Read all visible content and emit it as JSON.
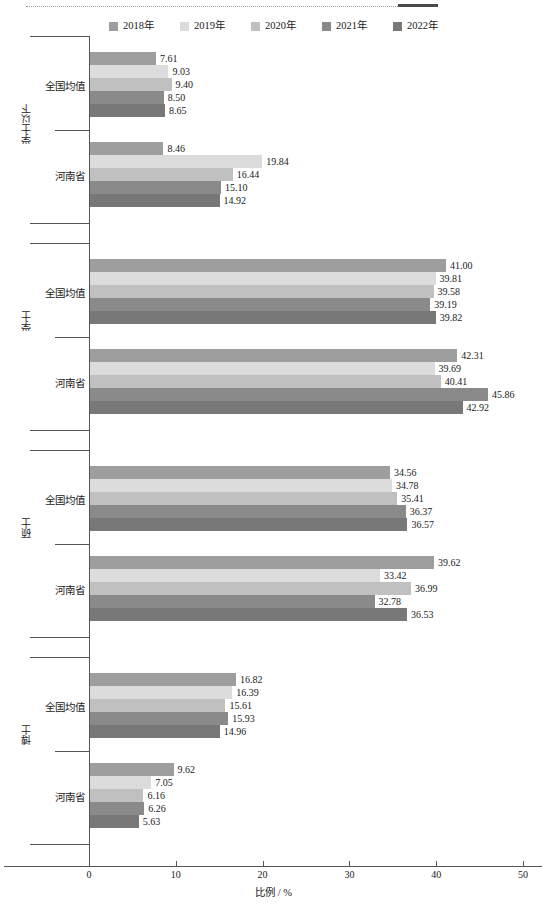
{
  "chart_data": {
    "type": "bar",
    "orientation": "horizontal",
    "title": "",
    "xlabel": "比例 / %",
    "ylabel": "",
    "xlim": [
      0,
      50
    ],
    "xticks": [
      0,
      10,
      20,
      30,
      40,
      50
    ],
    "grid": false,
    "legend_position": "top-center",
    "series": [
      {
        "name": "2018年",
        "color": "#9e9e9e"
      },
      {
        "name": "2019年",
        "color": "#dcdcdc"
      },
      {
        "name": "2020年",
        "color": "#c0c0c0"
      },
      {
        "name": "2021年",
        "color": "#8a8a8a"
      },
      {
        "name": "2022年",
        "color": "#787878"
      }
    ],
    "groups": [
      {
        "label": "学士以下",
        "categories": [
          {
            "name": "全国均值",
            "values": [
              7.61,
              9.03,
              9.4,
              8.5,
              8.65
            ],
            "labels": [
              "7.61",
              "9.03",
              "9.40",
              "8.50",
              "8.65"
            ]
          },
          {
            "name": "河南省",
            "values": [
              8.46,
              19.84,
              16.44,
              15.1,
              14.92
            ],
            "labels": [
              "8.46",
              "19.84",
              "16.44",
              "15.10",
              "14.92"
            ]
          }
        ]
      },
      {
        "label": "学士",
        "categories": [
          {
            "name": "全国均值",
            "values": [
              41.0,
              39.81,
              39.58,
              39.19,
              39.82
            ],
            "labels": [
              "41.00",
              "39.81",
              "39.58",
              "39.19",
              "39.82"
            ]
          },
          {
            "name": "河南省",
            "values": [
              42.31,
              39.69,
              40.41,
              45.86,
              42.92
            ],
            "labels": [
              "42.31",
              "39.69",
              "40.41",
              "45.86",
              "42.92"
            ]
          }
        ]
      },
      {
        "label": "硕士",
        "categories": [
          {
            "name": "全国均值",
            "values": [
              34.56,
              34.78,
              35.41,
              36.37,
              36.57
            ],
            "labels": [
              "34.56",
              "34.78",
              "35.41",
              "36.37",
              "36.57"
            ]
          },
          {
            "name": "河南省",
            "values": [
              39.62,
              33.42,
              36.99,
              32.78,
              36.53
            ],
            "labels": [
              "39.62",
              "33.42",
              "36.99",
              "32.78",
              "36.53"
            ]
          }
        ]
      },
      {
        "label": "博士",
        "categories": [
          {
            "name": "全国均值",
            "values": [
              16.82,
              16.39,
              15.61,
              15.93,
              14.96
            ],
            "labels": [
              "16.82",
              "16.39",
              "15.61",
              "15.93",
              "14.96"
            ]
          },
          {
            "name": "河南省",
            "values": [
              9.62,
              7.05,
              6.16,
              6.26,
              5.63
            ],
            "labels": [
              "9.62",
              "7.05",
              "6.16",
              "6.26",
              "5.63"
            ]
          }
        ]
      }
    ]
  }
}
